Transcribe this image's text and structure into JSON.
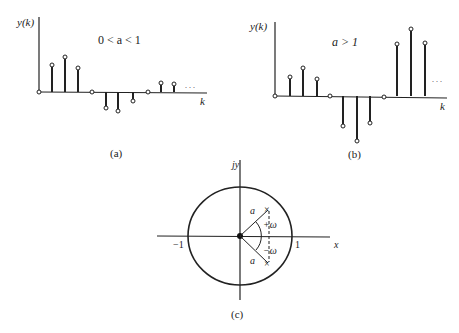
{
  "panels": {
    "a": {
      "caption": "(a)",
      "ylabel": "y(k)",
      "xlabel": "k",
      "condition": "0 < a < 1",
      "ellipsis": ". . .",
      "stems": [
        {
          "x": 39,
          "y": 92
        },
        {
          "x": 52,
          "y": 65
        },
        {
          "x": 65,
          "y": 57
        },
        {
          "x": 78,
          "y": 68
        },
        {
          "x": 92,
          "y": 92
        },
        {
          "x": 106,
          "y": 108
        },
        {
          "x": 118,
          "y": 111
        },
        {
          "x": 133,
          "y": 101
        },
        {
          "x": 148,
          "y": 92
        },
        {
          "x": 161,
          "y": 83
        },
        {
          "x": 174,
          "y": 84
        }
      ]
    },
    "b": {
      "caption": "(b)",
      "ylabel": "y(k)",
      "xlabel": "k",
      "condition": "a > 1",
      "ellipsis": ". . .",
      "stems": [
        {
          "x": 275,
          "y": 96
        },
        {
          "x": 290,
          "y": 77
        },
        {
          "x": 303,
          "y": 68
        },
        {
          "x": 317,
          "y": 79
        },
        {
          "x": 330,
          "y": 96
        },
        {
          "x": 343,
          "y": 126
        },
        {
          "x": 357,
          "y": 141
        },
        {
          "x": 370,
          "y": 123
        },
        {
          "x": 384,
          "y": 97
        },
        {
          "x": 397,
          "y": 44
        },
        {
          "x": 411,
          "y": 29
        },
        {
          "x": 425,
          "y": 43
        }
      ]
    },
    "c": {
      "caption": "(c)",
      "y_axis_label": "jy",
      "x_axis_label": "x",
      "minus_one_label": "−1",
      "one_label": "1",
      "radius_label": "a",
      "plus_omega_label": "+ω",
      "minus_omega_label": "−ω",
      "pole_marker": "×"
    }
  }
}
